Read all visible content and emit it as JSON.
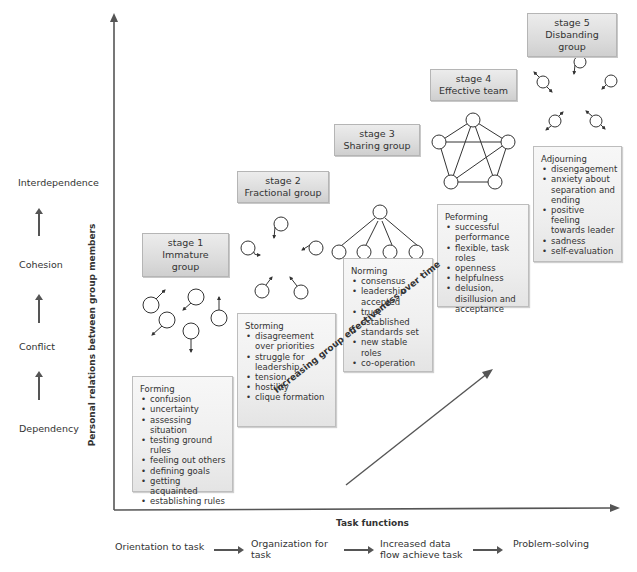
{
  "left_scale": {
    "labels": [
      "Interdependence",
      "Cohesion",
      "Conflict",
      "Dependency"
    ]
  },
  "axes": {
    "y_title": "Personal relations between group members",
    "x_title": "Task functions",
    "diagonal_label": "Increasing group effectiveness over time"
  },
  "stages": [
    {
      "number": "stage 1",
      "name": "Immature group"
    },
    {
      "number": "stage 2",
      "name": "Fractional group"
    },
    {
      "number": "stage 3",
      "name": "Sharing group"
    },
    {
      "number": "stage 4",
      "name": "Effective team"
    },
    {
      "number": "stage 5",
      "name": "Disbanding group"
    }
  ],
  "phases": [
    {
      "title": "Forming",
      "items": [
        "confusion",
        "uncertainty",
        "assessing situation",
        "testing ground rules",
        "feeling out others",
        "defining goals",
        "getting acquainted",
        "establishing rules"
      ]
    },
    {
      "title": "Storming",
      "items": [
        "disagreement over priorities",
        "struggle for leadership",
        "tension",
        "hostility",
        "clique formation"
      ]
    },
    {
      "title": "Norming",
      "items": [
        "consensus",
        "leadership accepted",
        "trust established",
        "standards set",
        "new stable roles",
        "co-operation"
      ]
    },
    {
      "title": "Peforming",
      "items": [
        "successful performance",
        "flexible, task roles",
        "openness",
        "helpfulness",
        "delusion, disillusion and acceptance"
      ]
    },
    {
      "title": "Adjourning",
      "items": [
        "disengagement",
        "anxiety  about separation and ending",
        "positive feeling towards leader",
        "sadness",
        "self-evaluation"
      ]
    }
  ],
  "task_sequence": [
    "Orientation to task",
    "Organization for task",
    "Increased data flow achieve task",
    "Problem-solving"
  ],
  "colors": {
    "axis": "#555555",
    "box_border": "#b5b5b5",
    "box_fill": "#e2e2e2",
    "text": "#333333"
  }
}
